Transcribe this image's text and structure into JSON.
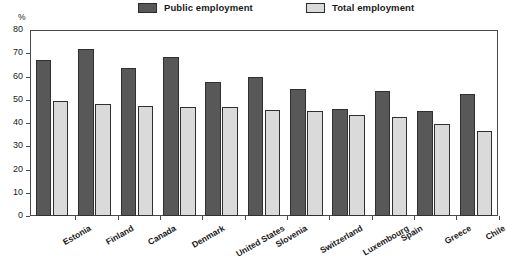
{
  "chart_data": {
    "type": "bar",
    "title": "",
    "subtitle": "",
    "xlabel": "",
    "ylabel": "%",
    "unit": "%",
    "ylim": [
      0,
      80
    ],
    "ytick_labels": [
      "80",
      "70",
      "60",
      "50",
      "40",
      "30",
      "20",
      "10",
      "0"
    ],
    "ytick_values": [
      80,
      70,
      60,
      50,
      40,
      30,
      20,
      10,
      0
    ],
    "grid": false,
    "legend_position": "top-center",
    "categories": [
      "Estonia",
      "Finland",
      "Canada",
      "Denmark",
      "United States",
      "Slovenia",
      "Switzerland",
      "Luxembourg",
      "Spain",
      "Greece",
      "Chile"
    ],
    "series": [
      {
        "name": "Public employment",
        "color": "#585858",
        "values": [
          67.2,
          72.0,
          63.8,
          68.3,
          57.6,
          59.6,
          54.5,
          46.0,
          53.6,
          45.0,
          52.6
        ]
      },
      {
        "name": "Total employment",
        "color": "#dadada",
        "values": [
          49.6,
          48.1,
          47.3,
          46.9,
          46.8,
          45.8,
          45.3,
          43.3,
          42.5,
          39.4,
          36.6
        ]
      }
    ]
  },
  "legend": {
    "items": [
      {
        "label": "Public employment",
        "swatch": "dark"
      },
      {
        "label": "Total employment",
        "swatch": "light"
      }
    ]
  }
}
